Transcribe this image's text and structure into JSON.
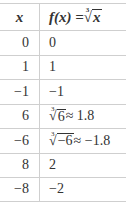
{
  "table": {
    "header": {
      "x": "x",
      "fx": "f(x) = ",
      "fx_radical_index": "3",
      "fx_radicand": "x"
    },
    "rows": [
      {
        "x": "0",
        "fx": "0"
      },
      {
        "x": "1",
        "fx": "1"
      },
      {
        "x": "−1",
        "fx": "−1"
      },
      {
        "x": "6",
        "fx_radical_index": "3",
        "fx_radicand": "6",
        "fx_approx": " ≈ 1.8"
      },
      {
        "x": "−6",
        "fx_radical_index": "3",
        "fx_radicand": "−6",
        "fx_approx": " ≈ −1.8"
      },
      {
        "x": "8",
        "fx": "2"
      },
      {
        "x": "−8",
        "fx": "−2"
      }
    ]
  },
  "colors": {
    "text": "#333333",
    "rule": "#cfcfcf",
    "background": "#ffffff"
  }
}
